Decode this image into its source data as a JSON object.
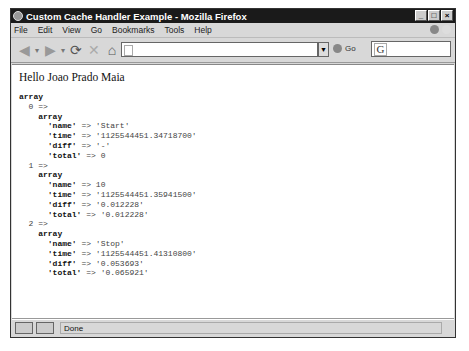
{
  "window": {
    "title": "Custom Cache Handler Example - Mozilla Firefox",
    "controls": [
      "_",
      "□",
      "×"
    ]
  },
  "menu": [
    "File",
    "Edit",
    "View",
    "Go",
    "Bookmarks",
    "Tools",
    "Help"
  ],
  "toolbar": {
    "back_icon": "◀",
    "forward_icon": "▶",
    "reload_icon": "⟳",
    "stop_icon": "✕",
    "home_icon": "⌂",
    "url": "",
    "go_label": "Go",
    "search_engine": "G"
  },
  "content": {
    "greeting": "Hello Joao Prado Maia",
    "dump_heading": "array",
    "entries": [
      {
        "index": "0",
        "name": "'Start'",
        "time": "'1125544451.34718700'",
        "diff": "'-'",
        "total": "0"
      },
      {
        "index": "1",
        "name": "10",
        "time": "'1125544451.35941500'",
        "diff": "'0.012228'",
        "total": "'0.012228'"
      },
      {
        "index": "2",
        "name": "'Stop'",
        "time": "'1125544451.41310800'",
        "diff": "'0.053693'",
        "total": "'0.065921'"
      }
    ]
  },
  "status": {
    "text": "Done"
  }
}
